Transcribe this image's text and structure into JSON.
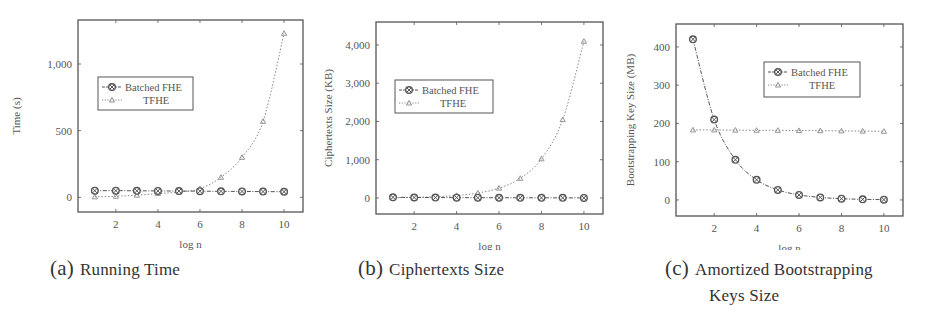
{
  "figure": {
    "subfigures": [
      {
        "label": "(a)",
        "caption": "Running Time"
      },
      {
        "label": "(b)",
        "caption": "Ciphertexts Size"
      },
      {
        "label": "(c)",
        "caption_line1": "Amortized Bootstrapping",
        "caption_line2": "Keys Size"
      }
    ]
  },
  "colors": {
    "axis": "#555555",
    "batched": "#555555",
    "tfhe": "#8a8a8a",
    "legend_border": "#555555"
  },
  "chart_data": [
    {
      "type": "line",
      "title": "Running Time",
      "xlabel": "log n",
      "ylabel": "Time (s)",
      "x": [
        1,
        2,
        3,
        4,
        5,
        6,
        7,
        8,
        9,
        10
      ],
      "xticks": [
        2,
        4,
        6,
        8,
        10
      ],
      "xlim": [
        0.2,
        10.9
      ],
      "ylim": [
        -110,
        1330
      ],
      "yticks": [
        0,
        500,
        1000
      ],
      "ytick_labels": [
        "0",
        "500",
        "1,000"
      ],
      "legend_position": "upper left",
      "series": [
        {
          "name": "Batched FHE",
          "marker": "circle-x",
          "style": "dash-dot",
          "values": [
            50,
            50,
            49,
            48,
            47,
            46,
            45,
            44,
            43,
            42
          ]
        },
        {
          "name": "TFHE",
          "marker": "triangle",
          "style": "dotted",
          "values": [
            4,
            8,
            16,
            28,
            40,
            65,
            150,
            300,
            570,
            1230
          ]
        }
      ]
    },
    {
      "type": "line",
      "title": "Ciphertexts Size",
      "xlabel": "log n",
      "ylabel": "Ciphertexts Size (KB)",
      "x": [
        1,
        2,
        3,
        4,
        5,
        6,
        7,
        8,
        9,
        10
      ],
      "xticks": [
        2,
        4,
        6,
        8,
        10
      ],
      "xlim": [
        0.2,
        10.9
      ],
      "ylim": [
        -420,
        4600
      ],
      "yticks": [
        0,
        1000,
        2000,
        3000,
        4000
      ],
      "ytick_labels": [
        "0",
        "1,000",
        "2,000",
        "3,000",
        "4,000"
      ],
      "legend_position": "upper left",
      "series": [
        {
          "name": "Batched FHE",
          "marker": "circle-x",
          "style": "dash-dot",
          "values": [
            16,
            12,
            10,
            8,
            6,
            5,
            4,
            3,
            2,
            1
          ]
        },
        {
          "name": "TFHE",
          "marker": "triangle",
          "style": "dotted",
          "values": [
            8,
            16,
            32,
            64,
            128,
            256,
            512,
            1024,
            2048,
            4096
          ]
        }
      ]
    },
    {
      "type": "line",
      "title": "Amortized Bootstrapping Keys Size",
      "xlabel": "log n",
      "ylabel": "Bootstrapping Key Size (MB)",
      "x": [
        1,
        2,
        3,
        4,
        5,
        6,
        7,
        8,
        9,
        10
      ],
      "xticks": [
        2,
        4,
        6,
        8,
        10
      ],
      "xlim": [
        0.2,
        10.9
      ],
      "ylim": [
        -42,
        460
      ],
      "yticks": [
        0,
        100,
        200,
        300,
        400
      ],
      "ytick_labels": [
        "0",
        "100",
        "200",
        "300",
        "400"
      ],
      "legend_position": "upper right",
      "series": [
        {
          "name": "Batched FHE",
          "marker": "circle-x",
          "style": "dash-dot",
          "values": [
            420,
            210,
            105,
            52.5,
            26.3,
            13.1,
            6.6,
            3.3,
            1.6,
            0.8
          ]
        },
        {
          "name": "TFHE",
          "marker": "triangle",
          "style": "dotted",
          "values": [
            183,
            183,
            182.5,
            182,
            182,
            181.5,
            181,
            180.5,
            180,
            179.5
          ]
        }
      ]
    }
  ]
}
